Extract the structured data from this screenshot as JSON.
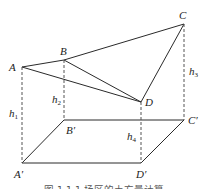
{
  "figure": {
    "points": {
      "A": "A",
      "B": "B",
      "C": "C",
      "D": "D",
      "A_prime": "A′",
      "B_prime": "B′",
      "C_prime": "C′",
      "D_prime": "D′"
    },
    "heights": {
      "h1": {
        "base": "h",
        "sub": "1"
      },
      "h2": {
        "base": "h",
        "sub": "2"
      },
      "h3": {
        "base": "h",
        "sub": "3"
      },
      "h4": {
        "base": "h",
        "sub": "4"
      }
    },
    "caption": "图 1.1.1  场区的土方量计算"
  }
}
